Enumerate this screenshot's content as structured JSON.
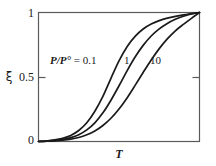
{
  "figure": {
    "background_color": "#ffffff",
    "frame_color": "#5a5a5a",
    "curve_color": "#1a1a1a"
  },
  "axes": {
    "y_label": "ξ",
    "x_label": "T",
    "y_ticks": [
      "1",
      "0.5",
      "0"
    ],
    "y_tick_top": "1",
    "y_tick_mid": "0.5",
    "y_tick_bottom": "0"
  },
  "annotations": {
    "ratio_prefix": "P/P°",
    "ratio_equals": " = ",
    "ratio_value": "0.1",
    "series_1": "1",
    "series_2": "10"
  },
  "chart_data": {
    "type": "line",
    "title": "",
    "subtitle": "",
    "xlabel": "T",
    "ylabel": "ξ",
    "xlim": [
      0,
      1
    ],
    "ylim": [
      0,
      1
    ],
    "x_ticks": [],
    "x_tick_labels": [],
    "y_ticks": [
      0,
      0.5,
      1
    ],
    "y_tick_labels": [
      "0",
      "0.5",
      "1"
    ],
    "grid": false,
    "legend": "inline-annotations",
    "legend_position": "inside-upper-left",
    "annotations": [
      {
        "text": "P/P° = 0.1",
        "x": 0.09,
        "y": 0.66
      },
      {
        "text": "1",
        "x": 0.53,
        "y": 0.66
      },
      {
        "text": "10",
        "x": 0.71,
        "y": 0.66
      }
    ],
    "series": [
      {
        "name": "P/P° = 0.1",
        "midpoint_x": 0.445,
        "x": [
          0.0,
          0.05,
          0.1,
          0.15,
          0.2,
          0.25,
          0.3,
          0.35,
          0.4,
          0.45,
          0.5,
          0.55,
          0.6,
          0.65,
          0.7,
          0.75,
          0.8,
          0.85,
          0.9,
          0.95,
          1.0
        ],
        "values": [
          0.0,
          0.005,
          0.012,
          0.025,
          0.047,
          0.085,
          0.145,
          0.235,
          0.35,
          0.49,
          0.625,
          0.735,
          0.815,
          0.872,
          0.91,
          0.937,
          0.956,
          0.97,
          0.981,
          0.991,
          1.0
        ]
      },
      {
        "name": "1",
        "midpoint_x": 0.628,
        "x": [
          0.0,
          0.05,
          0.1,
          0.15,
          0.2,
          0.25,
          0.3,
          0.35,
          0.4,
          0.45,
          0.5,
          0.55,
          0.6,
          0.65,
          0.7,
          0.75,
          0.8,
          0.85,
          0.9,
          0.95,
          1.0
        ],
        "values": [
          0.0,
          0.003,
          0.008,
          0.016,
          0.03,
          0.053,
          0.09,
          0.145,
          0.222,
          0.32,
          0.432,
          0.548,
          0.655,
          0.745,
          0.818,
          0.873,
          0.915,
          0.947,
          0.971,
          0.989,
          1.0
        ]
      },
      {
        "name": "10",
        "midpoint_x": 0.8,
        "x": [
          0.0,
          0.05,
          0.1,
          0.15,
          0.2,
          0.25,
          0.3,
          0.35,
          0.4,
          0.45,
          0.5,
          0.55,
          0.6,
          0.65,
          0.7,
          0.75,
          0.8,
          0.85,
          0.9,
          0.95,
          1.0
        ],
        "values": [
          0.0,
          0.002,
          0.005,
          0.01,
          0.018,
          0.031,
          0.052,
          0.082,
          0.124,
          0.18,
          0.252,
          0.338,
          0.435,
          0.535,
          0.632,
          0.72,
          0.795,
          0.858,
          0.908,
          0.955,
          1.0
        ]
      }
    ]
  }
}
